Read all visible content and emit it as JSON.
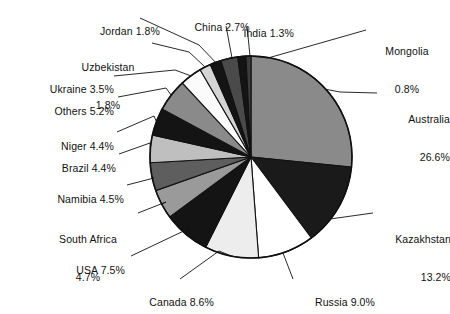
{
  "chart_data": {
    "type": "pie",
    "title": "",
    "subtitle": "",
    "xlabel": "",
    "ylabel": "",
    "legend_position": "callout-labels",
    "grid": false,
    "units": "percent",
    "start_angle_deg": 0,
    "direction": "clockwise",
    "categories": [
      "Australia",
      "Kazakhstan",
      "Russia",
      "Canada",
      "USA",
      "South Africa",
      "Namibia",
      "Brazil",
      "Niger",
      "Others",
      "Ukraine",
      "Uzbekistan",
      "Jordan",
      "China",
      "India",
      "Mongolia"
    ],
    "values": [
      26.6,
      13.2,
      9.0,
      8.6,
      7.5,
      4.7,
      4.5,
      4.4,
      4.4,
      5.2,
      3.5,
      1.8,
      1.8,
      2.7,
      1.3,
      0.8
    ],
    "slices": [
      {
        "label": "Australia",
        "value": 26.6,
        "value_text": "26.6%",
        "color": "#8a8a8a"
      },
      {
        "label": "Kazakhstan",
        "value": 13.2,
        "value_text": "13.2%",
        "color": "#1a1a1a"
      },
      {
        "label": "Russia",
        "value": 9.0,
        "value_text": "9.0%",
        "color": "#ffffff"
      },
      {
        "label": "Canada",
        "value": 8.6,
        "value_text": "8.6%",
        "color": "#ededed"
      },
      {
        "label": "USA",
        "value": 7.5,
        "value_text": "7.5%",
        "color": "#141414"
      },
      {
        "label": "South Africa",
        "value": 4.7,
        "value_text": "4.7%",
        "color": "#9a9a9a"
      },
      {
        "label": "Namibia",
        "value": 4.5,
        "value_text": "4.5%",
        "color": "#5e5e5e"
      },
      {
        "label": "Brazil",
        "value": 4.4,
        "value_text": "4.4%",
        "color": "#bfbfbf"
      },
      {
        "label": "Niger",
        "value": 4.4,
        "value_text": "4.4%",
        "color": "#141414"
      },
      {
        "label": "Others",
        "value": 5.2,
        "value_text": "5.2%",
        "color": "#8a8a8a"
      },
      {
        "label": "Ukraine",
        "value": 3.5,
        "value_text": "3.5%",
        "color": "#fbfbfb"
      },
      {
        "label": "Uzbekistan",
        "value": 1.8,
        "value_text": "1.8%",
        "color": "#d4d4d4"
      },
      {
        "label": "Jordan",
        "value": 1.8,
        "value_text": "1.8%",
        "color": "#141414"
      },
      {
        "label": "China",
        "value": 2.7,
        "value_text": "2.7%",
        "color": "#4a4a4a"
      },
      {
        "label": "India",
        "value": 1.3,
        "value_text": "1.3%",
        "color": "#141414"
      },
      {
        "label": "Mongolia",
        "value": 0.8,
        "value_text": "0.8%",
        "color": "#3d3d3d"
      }
    ]
  },
  "labels": {
    "jordan": {
      "line1": "Jordan 1.8%",
      "line2": ""
    },
    "china": {
      "line1": "China 2.7%",
      "line2": ""
    },
    "india": {
      "line1": "India 1.3%",
      "line2": ""
    },
    "mongolia": {
      "line1": "Mongolia",
      "line2": "0.8%"
    },
    "uzbekistan": {
      "line1": "Uzbekistan",
      "line2": "1.8%"
    },
    "ukraine": {
      "line1": "Ukraine 3.5%",
      "line2": ""
    },
    "others": {
      "line1": "Others 5.2%",
      "line2": ""
    },
    "niger": {
      "line1": "Niger 4.4%",
      "line2": ""
    },
    "brazil": {
      "line1": "Brazil 4.4%",
      "line2": ""
    },
    "namibia": {
      "line1": "Namibia 4.5%",
      "line2": ""
    },
    "south_africa": {
      "line1": "South Africa",
      "line2": "4.7%"
    },
    "usa": {
      "line1": "USA 7.5%",
      "line2": ""
    },
    "canada": {
      "line1": "Canada 8.6%",
      "line2": ""
    },
    "russia": {
      "line1": "Russia 9.0%",
      "line2": ""
    },
    "kazakhstan": {
      "line1": "Kazakhstan",
      "line2": "13.2%"
    },
    "australia": {
      "line1": "Australia",
      "line2": "26.6%"
    }
  },
  "style": {
    "outline_color": "#111111",
    "leader_color": "#111111",
    "background": "#ffffff"
  }
}
